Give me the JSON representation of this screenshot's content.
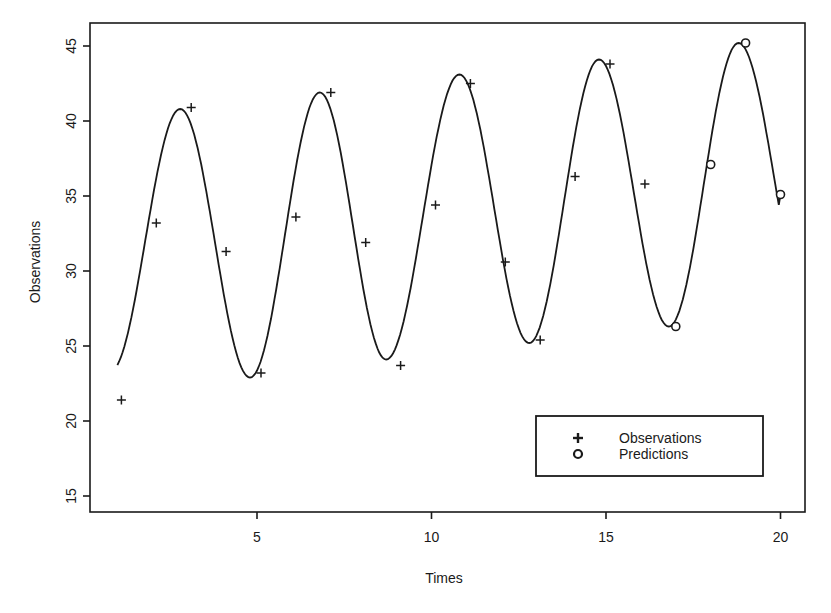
{
  "chart_data": {
    "type": "line",
    "title": "",
    "xlabel": "Times",
    "ylabel": "Observations",
    "xlim": [
      0.6,
      21.4
    ],
    "ylim": [
      14,
      46.6
    ],
    "x_ticks": [
      5,
      10,
      15,
      20
    ],
    "y_ticks": [
      15,
      20,
      25,
      30,
      35,
      40,
      45
    ],
    "grid": false,
    "legend_position": "lower right",
    "legend": [
      {
        "label": "Observations",
        "marker": "plus"
      },
      {
        "label": "Predictions",
        "marker": "circle"
      }
    ],
    "series": [
      {
        "name": "Observations",
        "marker": "plus",
        "x": [
          1,
          2,
          3,
          4,
          5,
          6,
          7,
          8,
          9,
          10,
          11,
          12,
          13,
          14,
          15,
          16
        ],
        "values": [
          21.4,
          33.2,
          40.9,
          31.3,
          23.2,
          33.6,
          41.9,
          31.9,
          23.7,
          34.4,
          42.5,
          30.6,
          25.4,
          36.3,
          43.8,
          35.8
        ]
      },
      {
        "name": "Predictions",
        "marker": "circle",
        "x": [
          17,
          18,
          19,
          20
        ],
        "values": [
          26.3,
          37.1,
          45.2,
          35.1
        ]
      },
      {
        "name": "Fitted curve",
        "marker": "none",
        "style": "solid line",
        "x_range": [
          1,
          20
        ],
        "peaks": [
          [
            2.8,
            40.8
          ],
          [
            6.8,
            41.9
          ],
          [
            10.8,
            43.1
          ],
          [
            14.8,
            44.1
          ],
          [
            18.8,
            45.2
          ]
        ],
        "troughs": [
          [
            4.8,
            22.9
          ],
          [
            8.7,
            24.1
          ],
          [
            12.8,
            25.2
          ],
          [
            16.8,
            26.3
          ]
        ],
        "start": [
          1,
          21.9
        ],
        "end": [
          20,
          35.1
        ]
      }
    ]
  },
  "layout": {
    "frame": {
      "left": 90,
      "top": 23,
      "right": 805,
      "bottom": 512
    },
    "x_axis": {
      "px_at_5": 257,
      "px_per_unit": 34.9
    },
    "y_axis": {
      "px_at_45": 46,
      "px_per_unit": 15
    },
    "legend_box": {
      "left": 536,
      "top": 416,
      "right": 763,
      "bottom": 476
    },
    "line_color": "#1a1a1a"
  }
}
